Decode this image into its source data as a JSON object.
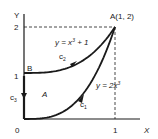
{
  "diagram": {
    "axes": {
      "x_label": "X",
      "y_label": "Y",
      "origin_label": "0",
      "x_ticks": [
        "1"
      ],
      "y_ticks": [
        "1",
        "2"
      ]
    },
    "points": {
      "A": "A(1, 2)",
      "B": "B"
    },
    "curves": {
      "c1": {
        "label": "c",
        "sub": "1",
        "equation": "y = 2x",
        "power": "3"
      },
      "c2": {
        "label": "c",
        "sub": "2",
        "equation": "y = x",
        "power": "3",
        "suffix": " + 1"
      },
      "c3": {
        "label": "c",
        "sub": "3"
      }
    },
    "region_label": "A",
    "colors": {
      "ink": "#1a1a1a"
    }
  }
}
